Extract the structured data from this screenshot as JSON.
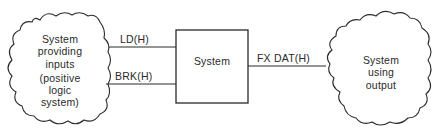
{
  "diagram": {
    "left_cloud": {
      "lines": [
        "System",
        "providing",
        "inputs",
        "(positive",
        "logic",
        "system)"
      ]
    },
    "center_box": {
      "label": "System"
    },
    "right_cloud": {
      "lines": [
        "System",
        "using",
        "output"
      ]
    },
    "signals": {
      "ld": "LD(H)",
      "brk": "BRK(H)",
      "fx_dat": "FX DAT(H)"
    },
    "colors": {
      "stroke": "#2a2a2a",
      "background": "#ffffff"
    }
  }
}
